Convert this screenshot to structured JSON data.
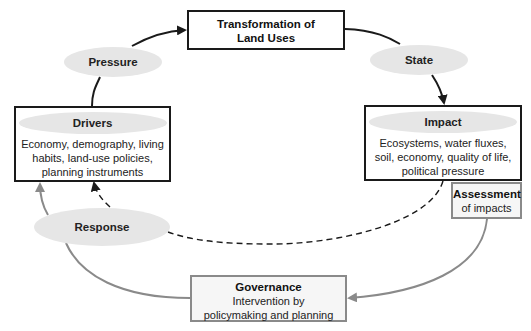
{
  "diagram": {
    "nodes": {
      "transformation": {
        "title_line1": "Transformation of",
        "title_line2": "Land Uses"
      },
      "pressure": {
        "label": "Pressure"
      },
      "state": {
        "label": "State"
      },
      "drivers": {
        "title": "Drivers",
        "body_line1": "Economy, demography, living",
        "body_line2": "habits, land-use policies,",
        "body_line3": "planning instruments"
      },
      "impact": {
        "title": "Impact",
        "body_line1": "Ecosystems, water fluxes,",
        "body_line2": "soil, economy, quality of life,",
        "body_line3": "political pressure"
      },
      "assessment": {
        "title": "Assessment",
        "body": "of impacts"
      },
      "response": {
        "label": "Response"
      },
      "governance": {
        "title": "Governance",
        "body_line1": "Intervention by",
        "body_line2": "policymaking and planning"
      }
    },
    "edges": [
      {
        "from": "drivers",
        "to": "transformation",
        "via": "pressure",
        "style": "solid-black"
      },
      {
        "from": "transformation",
        "to": "impact",
        "via": "state",
        "style": "solid-black"
      },
      {
        "from": "impact",
        "to": "drivers",
        "via": "response",
        "style": "dashed-black"
      },
      {
        "from": "assessment",
        "to": "governance",
        "style": "solid-gray"
      },
      {
        "from": "governance",
        "to": "drivers",
        "via": "response",
        "style": "solid-gray"
      }
    ],
    "colors": {
      "black_line": "#1a1a1a",
      "gray_line": "#8a8a8a",
      "ellipse_fill": "#e6e6e6",
      "gray_box_fill": "#f6f6f6"
    }
  }
}
